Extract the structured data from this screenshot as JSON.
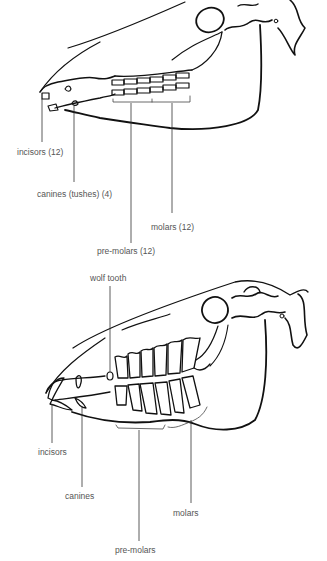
{
  "diagram": {
    "colors": {
      "line": "#111111",
      "label_text": "#555555",
      "leader": "#333333"
    },
    "top_figure": {
      "labels": [
        {
          "id": "incisors",
          "text": "incisors (12)"
        },
        {
          "id": "canines",
          "text": "canines (tushes) (4)"
        },
        {
          "id": "molars",
          "text": "molars (12)"
        },
        {
          "id": "premolars",
          "text": "pre-molars (12)"
        }
      ]
    },
    "bottom_figure": {
      "labels": [
        {
          "id": "wolf_tooth",
          "text": "wolf tooth"
        },
        {
          "id": "incisors",
          "text": "incisors"
        },
        {
          "id": "canines",
          "text": "canines"
        },
        {
          "id": "molars",
          "text": "molars"
        },
        {
          "id": "premolars",
          "text": "pre-molars"
        }
      ]
    }
  }
}
